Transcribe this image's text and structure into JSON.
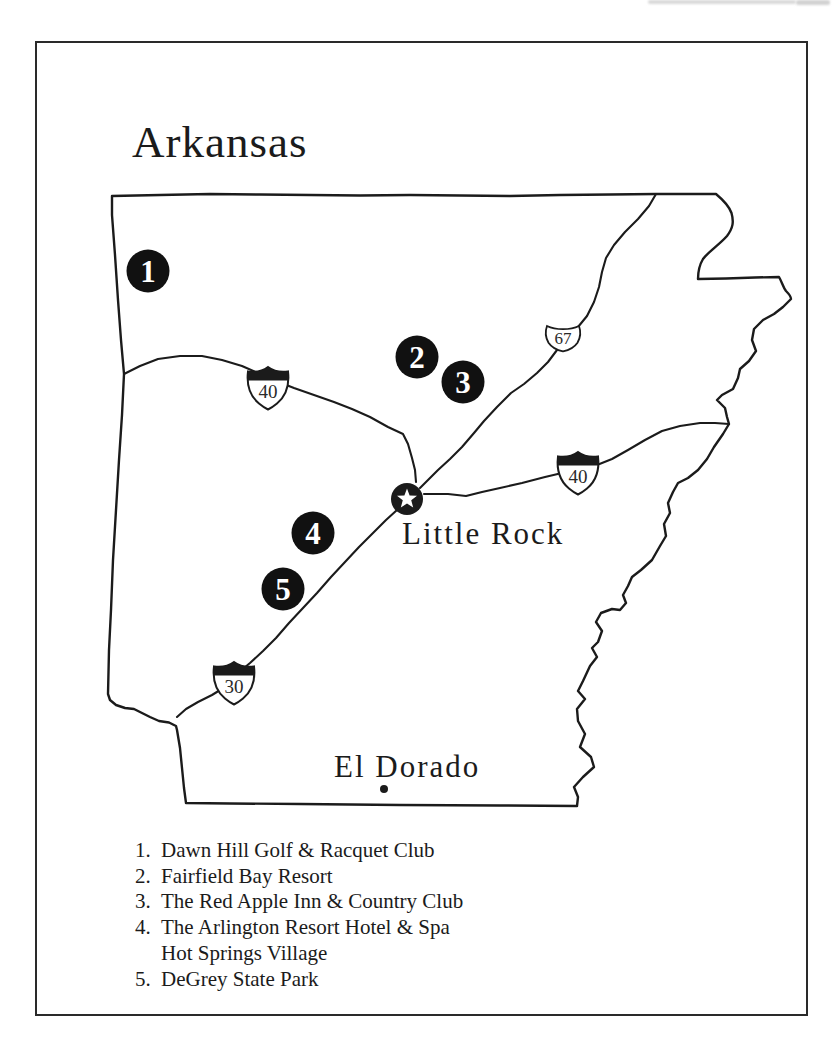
{
  "colors": {
    "ink": "#1b1b1b",
    "paper": "#ffffff"
  },
  "title": "Arkansas",
  "cities": {
    "little_rock": {
      "name": "Little Rock"
    },
    "el_dorado": {
      "name": "El Dorado"
    }
  },
  "shields": {
    "i40_west": {
      "type": "interstate",
      "number": "40"
    },
    "i40_east": {
      "type": "interstate",
      "number": "40"
    },
    "i30": {
      "type": "interstate",
      "number": "30"
    },
    "us67": {
      "type": "us-route",
      "number": "67"
    }
  },
  "markers": {
    "m1": "1",
    "m2": "2",
    "m3": "3",
    "m4": "4",
    "m5": "5"
  },
  "legend": {
    "items": [
      {
        "number": "1.",
        "label": "Dawn Hill Golf & Racquet Club"
      },
      {
        "number": "2.",
        "label": "Fairfield Bay Resort"
      },
      {
        "number": "3.",
        "label": "The Red Apple Inn & Country Club"
      },
      {
        "number": "4.",
        "label": "The Arlington Resort Hotel & Spa",
        "label2": "Hot Springs Village"
      },
      {
        "number": "5.",
        "label": "DeGrey State Park"
      }
    ]
  }
}
